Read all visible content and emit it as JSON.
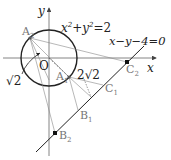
{
  "diagram": {
    "axes": {
      "x_label": "x",
      "y_label": "y",
      "origin_label": "O"
    },
    "circle": {
      "equation": "x²+y²=2",
      "eq_lhs": "x",
      "eq_mid": "+y",
      "eq_rhs": "=2",
      "exp": "2",
      "radius_label": "√2"
    },
    "line": {
      "equation": "x−y−4=0"
    },
    "points": {
      "A1": {
        "base": "A",
        "sub": "1"
      },
      "A2": {
        "base": "A",
        "sub": "2"
      },
      "B1": {
        "base": "B",
        "sub": "1"
      },
      "B2": {
        "base": "B",
        "sub": "2"
      },
      "C1": {
        "base": "C",
        "sub": "1"
      },
      "C2": {
        "base": "C",
        "sub": "2"
      }
    },
    "distance_label": "2√2",
    "colors": {
      "stroke": "#222222",
      "thin": "#888888",
      "label_grey": "#777777"
    }
  }
}
